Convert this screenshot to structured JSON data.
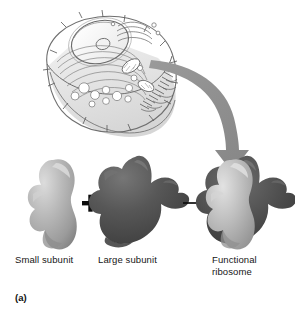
{
  "figure": {
    "panel_caption": "(a)",
    "cell_diagram": {
      "name": "eukaryotic-cell-cutaway",
      "organelles": [
        "nucleus",
        "nucleolus",
        "nuclear-envelope",
        "rough-endoplasmic-reticulum",
        "golgi-apparatus",
        "mitochondria",
        "vesicles",
        "plasma-membrane",
        "microvilli"
      ]
    },
    "assembly": {
      "small_subunit_label": "Small subunit",
      "large_subunit_label": "Large subunit",
      "functional_ribosome_label": "Functional\nribosome",
      "plus_symbol": "+",
      "arrow_symbol": "→"
    },
    "colors": {
      "small_subunit_light": "#c9c9c9",
      "small_subunit_mid": "#a6a6a6",
      "small_subunit_shadow": "#8a8a8a",
      "large_subunit_light": "#6a6a6a",
      "large_subunit_mid": "#4d4d4d",
      "large_subunit_shadow": "#343434",
      "curved_arrow": "#8f8f8f",
      "cell_outline": "#6f6f6f",
      "cell_fill": "#ffffff",
      "cell_base_shade": "#dcdcdc",
      "black_arrow": "#0d0d0d",
      "background": "#ffffff",
      "text": "#161616"
    }
  }
}
